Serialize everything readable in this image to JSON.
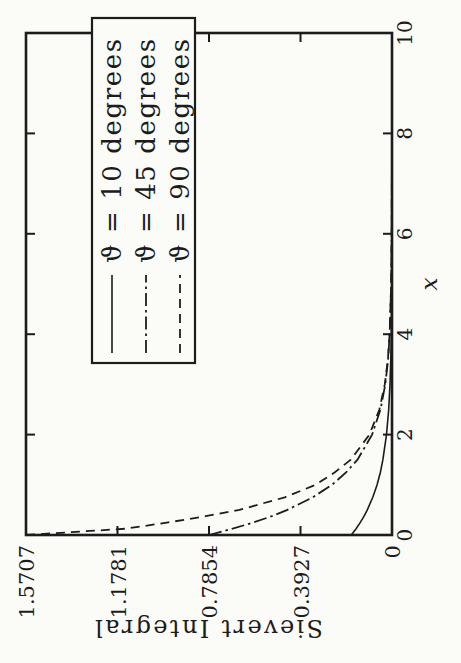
{
  "figure": {
    "paper_color": "#fbfbf8",
    "ink_color": "#1c1c1c",
    "orientation": "rotated-90-ccw"
  },
  "chart_data": {
    "type": "line",
    "title": "",
    "xlabel": "x",
    "ylabel": "Sievert Integral",
    "xlim": [
      0,
      10
    ],
    "ylim": [
      0,
      1.5707
    ],
    "grid": false,
    "legend_position": "top-right",
    "x_ticks": [
      0,
      2,
      4,
      6,
      8,
      10
    ],
    "x_tick_labels": [
      "0",
      "2",
      "4",
      "6",
      "8",
      "10"
    ],
    "y_ticks": [
      0,
      0.3927,
      0.7854,
      1.1781,
      1.5707
    ],
    "y_tick_labels": [
      "0",
      "0.3927",
      "0.7854",
      "1.1781",
      "1.5707"
    ],
    "x": [
      0,
      0.125,
      0.25,
      0.375,
      0.5,
      0.75,
      1,
      1.25,
      1.5,
      2,
      2.5,
      3,
      3.5,
      4,
      5,
      6,
      8,
      10
    ],
    "series": [
      {
        "name": "ϑ =  10  degrees",
        "style": "solid",
        "y": [
          0.1745,
          0.154,
          0.1359,
          0.1199,
          0.1058,
          0.0824,
          0.0641,
          0.0499,
          0.0389,
          0.0235,
          0.0142,
          0.0086,
          0.0052,
          0.0032,
          0.0012,
          0.0004,
          0.0001,
          0
        ]
      },
      {
        "name": "ϑ =  45  degrees",
        "style": "dash-dot",
        "y": [
          0.7854,
          0.684,
          0.5935,
          0.516,
          0.4489,
          0.3398,
          0.2574,
          0.196,
          0.1481,
          0.0854,
          0.0494,
          0.0287,
          0.0167,
          0.0097,
          0.0034,
          0.0012,
          0.0002,
          0
        ]
      },
      {
        "name": "ϑ =  90  degrees",
        "style": "dashed",
        "y": [
          1.5707,
          1.142,
          0.96,
          0.8,
          0.655,
          0.46,
          0.328,
          0.245,
          0.177,
          0.097,
          0.054,
          0.031,
          0.0177,
          0.0101,
          0.0034,
          0.0012,
          0.0002,
          0
        ]
      }
    ]
  }
}
